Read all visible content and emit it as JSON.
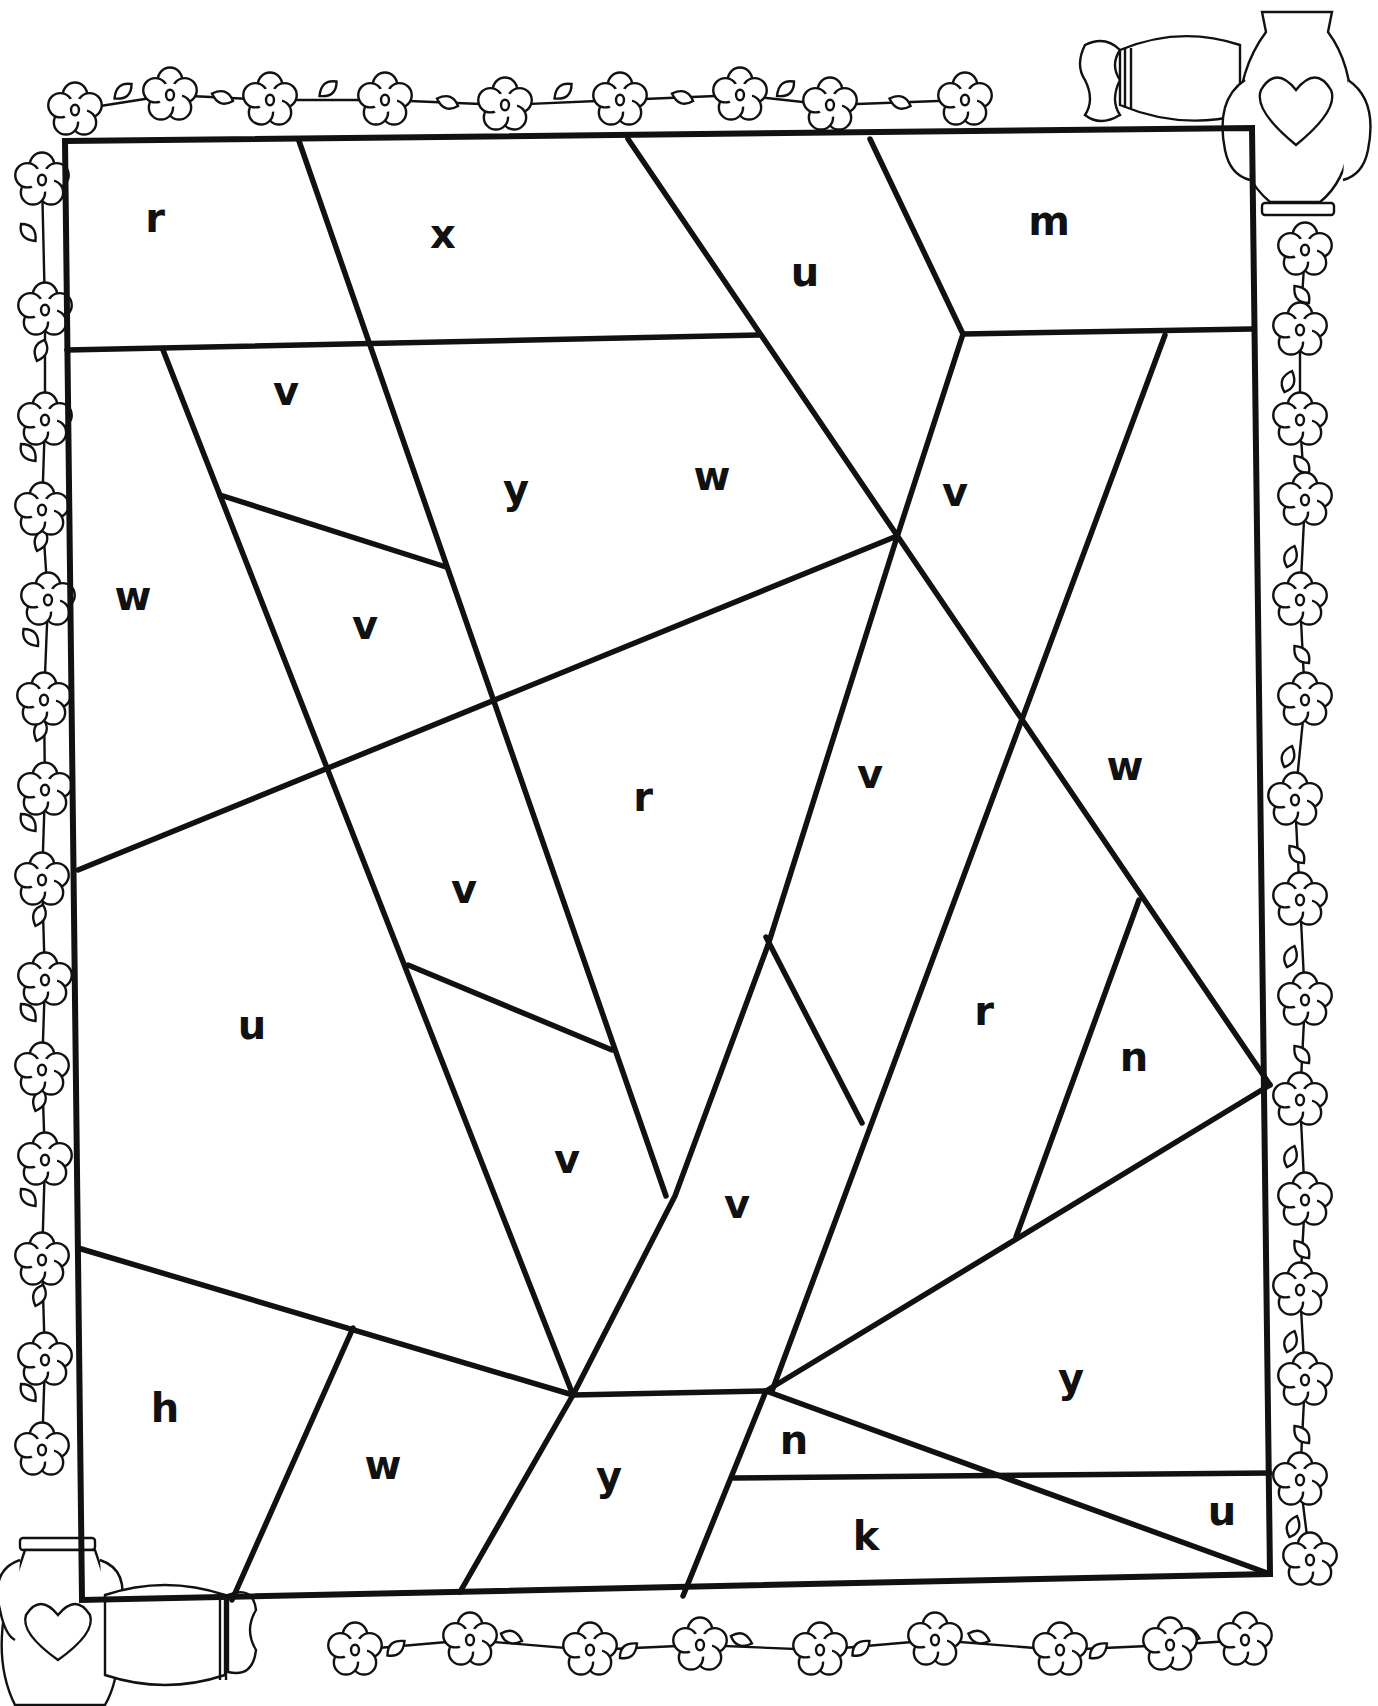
{
  "page": {
    "line_color": "#111111",
    "background": "#ffffff"
  },
  "frame": {
    "corners": [
      [
        65,
        141
      ],
      [
        1252,
        128
      ],
      [
        1270,
        1574
      ],
      [
        82,
        1600
      ]
    ]
  },
  "regions_lines": [
    [
      [
        299,
        141
      ],
      [
        666,
        1196
      ]
    ],
    [
      [
        67,
        350
      ],
      [
        759,
        335
      ]
    ],
    [
      [
        163,
        350
      ],
      [
        573,
        1395
      ]
    ],
    [
      [
        220,
        495
      ],
      [
        446,
        567
      ]
    ],
    [
      [
        628,
        139
      ],
      [
        1270,
        1085
      ]
    ],
    [
      [
        870,
        139
      ],
      [
        963,
        334
      ]
    ],
    [
      [
        963,
        334
      ],
      [
        1252,
        329
      ]
    ],
    [
      [
        963,
        334
      ],
      [
        897,
        537
      ],
      [
        768,
        945
      ],
      [
        675,
        1196
      ],
      [
        573,
        1395
      ]
    ],
    [
      [
        78,
        870
      ],
      [
        897,
        536
      ]
    ],
    [
      [
        408,
        965
      ],
      [
        612,
        1050
      ]
    ],
    [
      [
        766,
        937
      ],
      [
        862,
        1123
      ]
    ],
    [
      [
        1165,
        335
      ],
      [
        772,
        1391
      ]
    ],
    [
      [
        1139,
        900
      ],
      [
        1016,
        1237
      ]
    ],
    [
      [
        1270,
        1085
      ],
      [
        766,
        1391
      ]
    ],
    [
      [
        78,
        1248
      ],
      [
        573,
        1395
      ]
    ],
    [
      [
        353,
        1328
      ],
      [
        232,
        1600
      ]
    ],
    [
      [
        573,
        1395
      ],
      [
        460,
        1592
      ]
    ],
    [
      [
        573,
        1395
      ],
      [
        766,
        1391
      ]
    ],
    [
      [
        766,
        1391
      ],
      [
        683,
        1596
      ]
    ],
    [
      [
        766,
        1391
      ],
      [
        1270,
        1574
      ]
    ],
    [
      [
        734,
        1478
      ],
      [
        1270,
        1473
      ]
    ]
  ],
  "letters": [
    {
      "char": "r",
      "x": 155,
      "y": 218
    },
    {
      "char": "x",
      "x": 443,
      "y": 234
    },
    {
      "char": "u",
      "x": 805,
      "y": 272
    },
    {
      "char": "m",
      "x": 1049,
      "y": 221
    },
    {
      "char": "v",
      "x": 286,
      "y": 391
    },
    {
      "char": "y",
      "x": 516,
      "y": 489
    },
    {
      "char": "w",
      "x": 712,
      "y": 476
    },
    {
      "char": "v",
      "x": 955,
      "y": 492
    },
    {
      "char": "w",
      "x": 133,
      "y": 596
    },
    {
      "char": "v",
      "x": 365,
      "y": 625
    },
    {
      "char": "r",
      "x": 643,
      "y": 797
    },
    {
      "char": "v",
      "x": 870,
      "y": 774
    },
    {
      "char": "w",
      "x": 1125,
      "y": 766
    },
    {
      "char": "v",
      "x": 464,
      "y": 889
    },
    {
      "char": "u",
      "x": 252,
      "y": 1025
    },
    {
      "char": "r",
      "x": 984,
      "y": 1011
    },
    {
      "char": "n",
      "x": 1134,
      "y": 1057
    },
    {
      "char": "v",
      "x": 567,
      "y": 1159
    },
    {
      "char": "v",
      "x": 737,
      "y": 1204
    },
    {
      "char": "y",
      "x": 1071,
      "y": 1378
    },
    {
      "char": "h",
      "x": 165,
      "y": 1408
    },
    {
      "char": "w",
      "x": 383,
      "y": 1465
    },
    {
      "char": "y",
      "x": 609,
      "y": 1476
    },
    {
      "char": "n",
      "x": 794,
      "y": 1440
    },
    {
      "char": "k",
      "x": 866,
      "y": 1536
    },
    {
      "char": "u",
      "x": 1222,
      "y": 1511
    }
  ],
  "decorations": {
    "top_flowers": [
      [
        75,
        110
      ],
      [
        170,
        95
      ],
      [
        270,
        100
      ],
      [
        385,
        100
      ],
      [
        505,
        105
      ],
      [
        620,
        100
      ],
      [
        740,
        95
      ],
      [
        830,
        105
      ],
      [
        965,
        100
      ]
    ],
    "right_flowers": [
      [
        1305,
        250
      ],
      [
        1300,
        330
      ],
      [
        1300,
        420
      ],
      [
        1305,
        500
      ],
      [
        1300,
        600
      ],
      [
        1305,
        700
      ],
      [
        1295,
        800
      ],
      [
        1300,
        900
      ],
      [
        1305,
        1000
      ],
      [
        1300,
        1100
      ],
      [
        1305,
        1200
      ],
      [
        1300,
        1290
      ],
      [
        1305,
        1380
      ],
      [
        1300,
        1480
      ],
      [
        1310,
        1560
      ]
    ],
    "left_flowers": [
      [
        42,
        180
      ],
      [
        45,
        310
      ],
      [
        45,
        420
      ],
      [
        42,
        510
      ],
      [
        48,
        600
      ],
      [
        44,
        700
      ],
      [
        45,
        790
      ],
      [
        42,
        880
      ],
      [
        45,
        980
      ],
      [
        42,
        1070
      ],
      [
        45,
        1160
      ],
      [
        42,
        1260
      ],
      [
        45,
        1360
      ],
      [
        42,
        1450
      ]
    ],
    "bottom_flowers": [
      [
        355,
        1650
      ],
      [
        470,
        1640
      ],
      [
        590,
        1650
      ],
      [
        700,
        1645
      ],
      [
        820,
        1650
      ],
      [
        935,
        1640
      ],
      [
        1060,
        1650
      ],
      [
        1170,
        1645
      ],
      [
        1245,
        1640
      ]
    ],
    "vase_top_right": {
      "x": 1250,
      "y": 30
    },
    "vase_bottom_left": {
      "x": 0,
      "y": 1540
    }
  }
}
